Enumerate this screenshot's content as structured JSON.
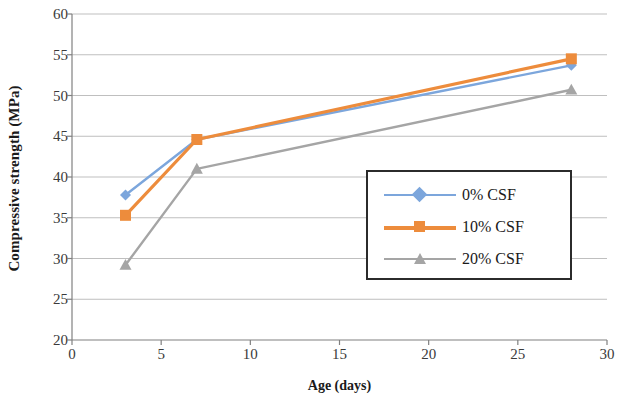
{
  "chart_data": {
    "type": "line",
    "title": "",
    "xlabel": "Age (days)",
    "ylabel": "Compressive strength (MPa)",
    "xlim": [
      0,
      30
    ],
    "ylim": [
      20,
      60
    ],
    "x_ticks": [
      0,
      5,
      10,
      15,
      20,
      25,
      30
    ],
    "y_ticks": [
      20,
      25,
      30,
      35,
      40,
      45,
      50,
      55,
      60
    ],
    "grid": "horizontal",
    "legend_position": "lower-right-inside",
    "x": [
      3,
      7,
      28
    ],
    "series": [
      {
        "name": "0% CSF",
        "color": "#7CA6DC",
        "marker": "diamond",
        "values": [
          37.8,
          44.6,
          53.7
        ]
      },
      {
        "name": "10% CSF",
        "color": "#ED8C3C",
        "marker": "square",
        "values": [
          35.3,
          44.6,
          54.5
        ]
      },
      {
        "name": "20% CSF",
        "color": "#A5A5A5",
        "marker": "triangle",
        "values": [
          29.2,
          41.0,
          50.7
        ]
      }
    ]
  },
  "axes": {
    "x_title": "Age (days)",
    "y_title": "Compressive strength (MPa)",
    "x_tick_labels": [
      "0",
      "5",
      "10",
      "15",
      "20",
      "25",
      "30"
    ],
    "y_tick_labels": [
      "20",
      "25",
      "30",
      "35",
      "40",
      "45",
      "50",
      "55",
      "60"
    ]
  },
  "legend": {
    "entries": [
      {
        "label": "0% CSF",
        "color": "#7CA6DC"
      },
      {
        "label": "10% CSF",
        "color": "#ED8C3C"
      },
      {
        "label": "20% CSF",
        "color": "#A5A5A5"
      }
    ]
  },
  "colors": {
    "series_0": "#7CA6DC",
    "series_1": "#ED8C3C",
    "series_2": "#A5A5A5",
    "axis": "#808080",
    "grid": "#BFBFBF",
    "text": "#1a1a1a"
  }
}
